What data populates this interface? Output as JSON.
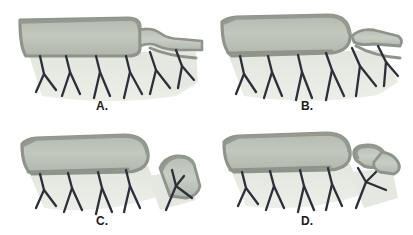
{
  "figure": {
    "type": "anatomical-illustration",
    "panel_count": 4,
    "background_color": "#ffffff",
    "colors": {
      "bowel_fill": "#b9bfb4",
      "bowel_fill_light": "#c8cdc2",
      "bowel_border": "#8e948a",
      "bowel_border_dark": "#7e857a",
      "mesentery_fill": "#dfe2da",
      "mesentery_fill_light": "#e7e9e2",
      "vessel": "#2b2f3a",
      "label_color": "#1b1b1b"
    }
  },
  "panels": [
    {
      "id": "a",
      "label": "A.",
      "description": "Bowel continuous with a narrowed tapering neck leading to an attached distal limb; mesenteric arcades intact",
      "segment_state": "attached-tapered-neck"
    },
    {
      "id": "b",
      "label": "B.",
      "description": "Bowel divided; proximal end closed and rounded, distal limb separated as a closed loop above the mesentery",
      "segment_state": "divided-closed-ends"
    },
    {
      "id": "c",
      "label": "C.",
      "description": "Distal limb fully separated and rotated upright beside the closed proximal bowel, carrying its own vascular pedicle",
      "segment_state": "separated-rotated-upright"
    },
    {
      "id": "d",
      "label": "D.",
      "description": "Separated limb folded and kinked over itself forming a narrowed twisted loop on its vascular pedicle",
      "segment_state": "folded-twisted-loop"
    }
  ]
}
